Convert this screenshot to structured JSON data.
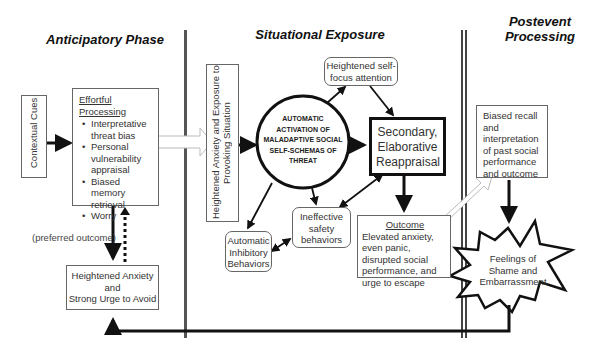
{
  "phases": {
    "anticipatory": "Anticipatory Phase",
    "situational": "Situational Exposure",
    "postevent_line1": "Postevent",
    "postevent_line2": "Processing"
  },
  "nodes": {
    "contextual_cues": "Contextual Cues",
    "effortful_processing": {
      "title": "Effortful Processing",
      "items": [
        "Interpretative threat bias",
        "Personal vulnerability appraisal",
        "Biased memory retrieval",
        "Worry"
      ]
    },
    "heightened_anxiety_avoid": {
      "line1": "Heightened Anxiety",
      "line2": "and",
      "line3": "Strong Urge to Avoid"
    },
    "preferred_outcome": "(preferred outcome)",
    "exposure": {
      "line1": "Heightened Anxiety and Exposure to",
      "line2": "Provoking Situation"
    },
    "automatic_activation": {
      "line1": "Automatic",
      "line2": "activation of",
      "line3": "maladaptive social",
      "line4": "self-schemas of",
      "line5": "threat"
    },
    "self_focus": "Heightened self-focus attention",
    "secondary_reappraisal": "Secondary, Elaborative Reappraisal",
    "ineffective_safety": "Ineffective safety behaviors",
    "automatic_inhibitory": "Automatic Inhibitory Behaviors",
    "outcome": {
      "title": "Outcome",
      "text": "Elevated anxiety, even panic, disrupted social performance, and urge to escape"
    },
    "biased_recall": "Biased recall and interpretation of past social performance and outcome",
    "shame": "Feelings of Shame and Embarrassment"
  },
  "colors": {
    "line": "#111111",
    "box_border": "#666666",
    "divider": "#555555",
    "hollow_arrow": "#bbbbbb"
  }
}
